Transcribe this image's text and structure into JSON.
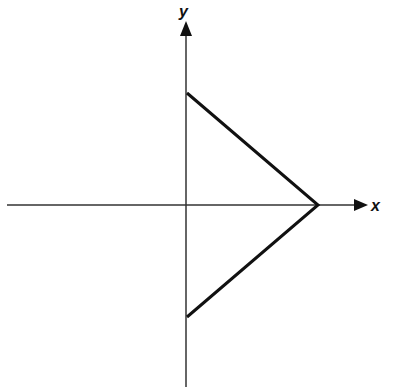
{
  "diagram": {
    "axes": {
      "x_label": "x",
      "y_label": "y",
      "origin_px": [
        186,
        205
      ]
    },
    "shape": {
      "type": "polyline",
      "vertices_px": [
        [
          187,
          93
        ],
        [
          318,
          205
        ],
        [
          187,
          317
        ]
      ],
      "stroke": "#111111"
    },
    "colors": {
      "background": "#ffffff",
      "axis": "#333333",
      "shape": "#111111"
    }
  }
}
